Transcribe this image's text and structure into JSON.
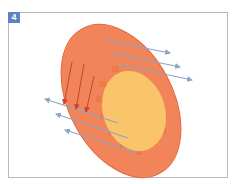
{
  "figure": {
    "panel_label": "4",
    "colors": {
      "badge": "#5d82c4",
      "outer_cell": "#f2845a",
      "outer_cell_edge": "#e0673f",
      "inner_nucleus": "#fac56a",
      "nucleus_bumps": "#f07a45",
      "blue_arrows": "#8fa3c4",
      "red_arrows": "#c9442a",
      "frame": "#b9b9b9"
    },
    "elements": {
      "outer_ellipse": {
        "cx": 121,
        "cy": 101,
        "rx": 52,
        "ry": 82,
        "rotate": -28
      },
      "inner_ellipse": {
        "cx": 134,
        "cy": 111,
        "rx": 31,
        "ry": 41,
        "rotate": -18
      },
      "blue_arrows_right": [
        {
          "x1": 103,
          "y1": 40,
          "x2": 170,
          "y2": 53
        },
        {
          "x1": 112,
          "y1": 53,
          "x2": 180,
          "y2": 67
        },
        {
          "x1": 118,
          "y1": 64,
          "x2": 192,
          "y2": 80
        }
      ],
      "blue_arrows_left": [
        {
          "x1": 118,
          "y1": 123,
          "x2": 45,
          "y2": 99
        },
        {
          "x1": 128,
          "y1": 138,
          "x2": 56,
          "y2": 114
        },
        {
          "x1": 138,
          "y1": 153,
          "x2": 65,
          "y2": 130
        }
      ],
      "red_arrows": [
        {
          "x1": 72,
          "y1": 62,
          "x2": 64,
          "y2": 104
        },
        {
          "x1": 84,
          "y1": 64,
          "x2": 76,
          "y2": 109
        },
        {
          "x1": 94,
          "y1": 76,
          "x2": 86,
          "y2": 112
        }
      ]
    }
  }
}
